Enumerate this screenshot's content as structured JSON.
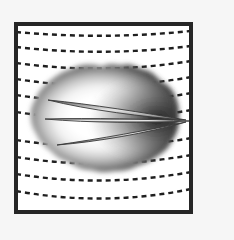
{
  "figure": {
    "title": "Micrograph illustration of lobed cell body with three elongated spindle structures",
    "caption": "",
    "background_color": "#f6f6f6",
    "panel": {
      "name": "framed-panel",
      "x": 14,
      "y": 22,
      "width": 179,
      "height": 192,
      "fill_color": "#ffffff",
      "border_color": "#262626",
      "border_width": 4
    },
    "striations": {
      "name": "dashed-striation-lines",
      "count": 10,
      "stroke_color": "#1f1f1f",
      "stroke_width": 2.4,
      "dash_pattern": "5 4",
      "description": "Horizontal dashed lines curving gently downward toward the center",
      "lines": [
        {
          "left_y": 32,
          "mid_y": 36,
          "right_y": 31,
          "sag": 4
        },
        {
          "left_y": 47,
          "mid_y": 52,
          "right_y": 46,
          "sag": 5
        },
        {
          "left_y": 63,
          "mid_y": 69,
          "right_y": 61,
          "sag": 6
        },
        {
          "left_y": 79,
          "mid_y": 86,
          "right_y": 77,
          "sag": 7
        },
        {
          "left_y": 95,
          "mid_y": 102,
          "right_y": 93,
          "sag": 7
        },
        {
          "left_y": 112,
          "mid_y": 119,
          "right_y": 110,
          "sag": 7
        },
        {
          "left_y": 140,
          "mid_y": 147,
          "right_y": 138,
          "sag": 7
        },
        {
          "left_y": 157,
          "mid_y": 164,
          "right_y": 155,
          "sag": 7
        },
        {
          "left_y": 174,
          "mid_y": 181,
          "right_y": 172,
          "sag": 7
        },
        {
          "left_y": 191,
          "mid_y": 199,
          "right_y": 189,
          "sag": 8
        }
      ]
    },
    "blob": {
      "name": "lobed-cell-body",
      "center_x": 103,
      "center_y": 119,
      "radius_x": 75,
      "radius_y": 52,
      "lobe_count": 17,
      "lobe_amplitude": 5.5,
      "edge_color": "#0d0d0d",
      "mid_color": "#777777",
      "center_color": "#ffffff",
      "description": "Irregular bumpy ellipse, dark at edges fading to white at the center"
    },
    "spindles": {
      "name": "spindle-structures",
      "count": 3,
      "outline_color": "#3a3a3a",
      "fill_light": "#f0f0f0",
      "fill_dark": "#8d8d8d",
      "converge_x": 186,
      "converge_y": 120,
      "items": [
        {
          "label": "upper-spindle",
          "tip_x": 48,
          "tip_y": 100,
          "bulge": 5.5
        },
        {
          "label": "middle-spindle",
          "tip_x": 45,
          "tip_y": 119,
          "bulge": 3.2
        },
        {
          "label": "lower-spindle",
          "tip_x": 57,
          "tip_y": 145,
          "bulge": 5.0
        }
      ]
    }
  }
}
